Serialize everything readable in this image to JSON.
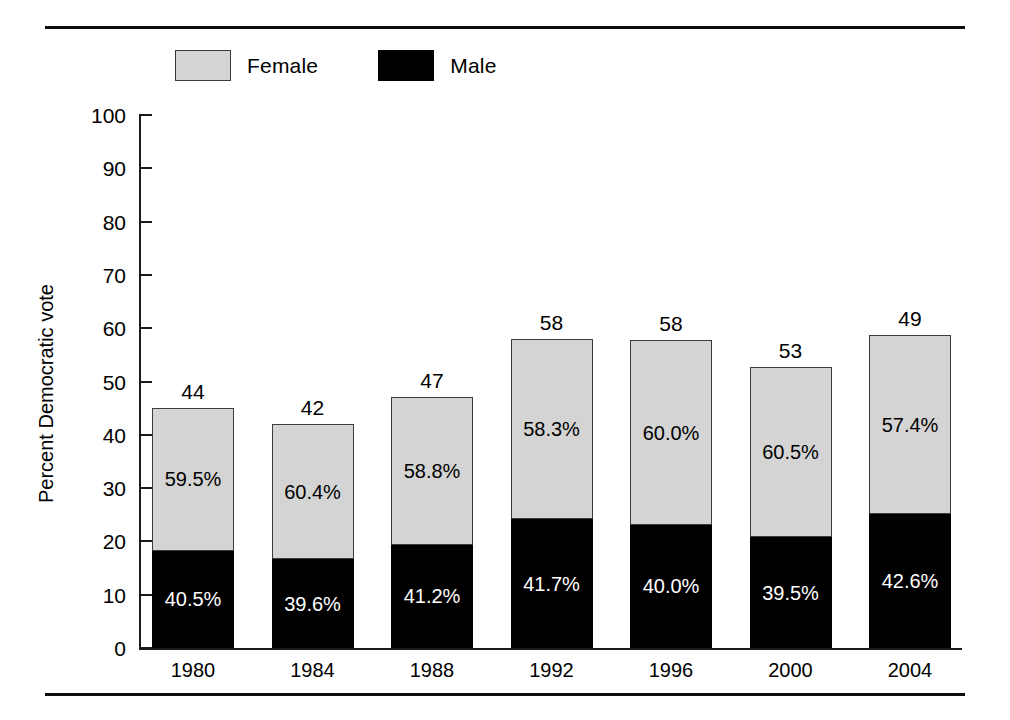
{
  "legend": {
    "items": [
      {
        "label": "Female",
        "swatch": "female-swatch",
        "color": "#d4d4d4"
      },
      {
        "label": "Male",
        "swatch": "male-swatch",
        "color": "#000000"
      }
    ]
  },
  "chart_data": {
    "type": "bar",
    "subtype": "stacked-percent",
    "title": "",
    "xlabel": "",
    "ylabel": "Percent Democratic vote",
    "ylim": [
      0,
      100
    ],
    "yticks": [
      0,
      10,
      20,
      30,
      40,
      50,
      60,
      70,
      80,
      90,
      100
    ],
    "ytick_labels": [
      "0",
      "10",
      "20",
      "30",
      "40",
      "50",
      "60",
      "70",
      "80",
      "90",
      "100"
    ],
    "grid": false,
    "legend_position": "top-left",
    "categories": [
      "1980",
      "1984",
      "1988",
      "1992",
      "1996",
      "2000",
      "2004"
    ],
    "bar_totals": [
      44,
      42,
      47,
      58,
      58,
      53,
      49
    ],
    "bar_total_labels": [
      "44",
      "42",
      "47",
      "58",
      "58",
      "53",
      "49"
    ],
    "bar_heights_plotted": [
      45.0,
      42.0,
      47.0,
      58.0,
      57.7,
      52.7,
      58.8
    ],
    "series": [
      {
        "name": "Female",
        "color": "#d4d4d4",
        "values": [
          59.5,
          60.4,
          58.8,
          58.3,
          60.0,
          60.5,
          57.4
        ],
        "labels": [
          "59.5%",
          "60.4%",
          "58.8%",
          "58.3%",
          "60.0%",
          "60.5%",
          "57.4%"
        ]
      },
      {
        "name": "Male",
        "color": "#000000",
        "values": [
          40.5,
          39.6,
          41.2,
          41.7,
          40.0,
          39.5,
          42.6
        ],
        "labels": [
          "40.5%",
          "39.6%",
          "41.2%",
          "41.7%",
          "40.0%",
          "39.5%",
          "42.6%"
        ]
      }
    ]
  }
}
